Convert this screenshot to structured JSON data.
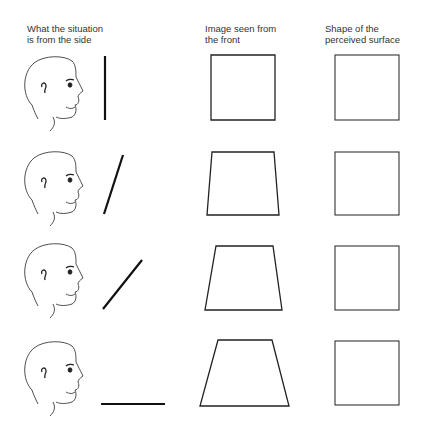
{
  "headers": [
    {
      "text": "What the situation\nis from the side",
      "x": 27,
      "y": 23
    },
    {
      "text": "Image seen from\nthe front",
      "x": 205,
      "y": 23
    },
    {
      "text": "Shape of the\nperceived surface",
      "x": 325,
      "y": 23
    }
  ],
  "rows": [
    {
      "label": "vertical surface",
      "line": [
        105,
        56,
        105,
        120
      ],
      "trap": [
        [
          211,
          55
        ],
        [
          275,
          55
        ],
        [
          275,
          120
        ],
        [
          211,
          120
        ]
      ],
      "square": [
        335,
        55,
        399,
        120
      ],
      "head_y": 55
    },
    {
      "label": "tilted surface",
      "line": [
        123,
        155,
        104,
        214
      ],
      "trap": [
        [
          212,
          152
        ],
        [
          274,
          152
        ],
        [
          279,
          215
        ],
        [
          207,
          215
        ]
      ],
      "square": [
        335,
        152,
        399,
        215
      ],
      "head_y": 150
    },
    {
      "label": "more tilted surface",
      "line": [
        142,
        260,
        103,
        309
      ],
      "trap": [
        [
          216,
          246
        ],
        [
          273,
          246
        ],
        [
          282,
          310
        ],
        [
          205,
          310
        ]
      ],
      "square": [
        335,
        246,
        399,
        310
      ],
      "head_y": 242
    },
    {
      "label": "horizontal surface",
      "line": [
        101,
        404,
        165,
        404
      ],
      "trap": [
        [
          218,
          340
        ],
        [
          272,
          340
        ],
        [
          289,
          406
        ],
        [
          200,
          406
        ]
      ],
      "square": [
        335,
        341,
        399,
        405
      ],
      "head_y": 340
    }
  ]
}
